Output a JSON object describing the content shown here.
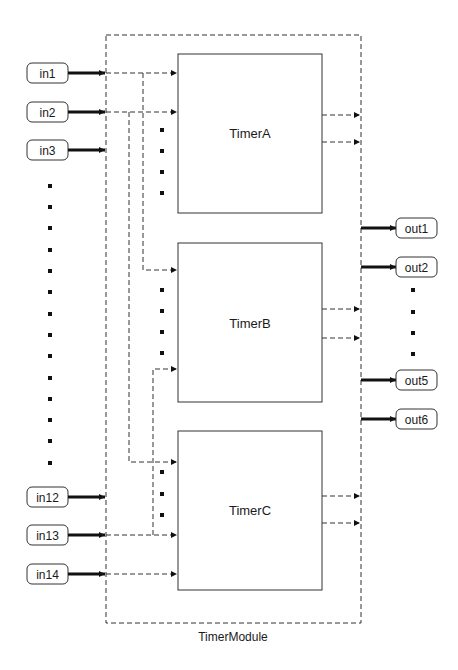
{
  "diagram": {
    "module": {
      "label": "TimerModule"
    },
    "blocks": [
      {
        "id": "A",
        "label": "TimerA"
      },
      {
        "id": "B",
        "label": "TimerB"
      },
      {
        "id": "C",
        "label": "TimerC"
      }
    ],
    "inputs": [
      {
        "label": "in1"
      },
      {
        "label": "in2"
      },
      {
        "label": "in3"
      },
      {
        "label": "in12"
      },
      {
        "label": "in13"
      },
      {
        "label": "in14"
      }
    ],
    "outputs": [
      {
        "label": "out1"
      },
      {
        "label": "out2"
      },
      {
        "label": "out5"
      },
      {
        "label": "out6"
      }
    ],
    "colors": {
      "stroke": "#2a2a2a",
      "fill": "#ffffff",
      "text": "#1a1a1a"
    }
  }
}
